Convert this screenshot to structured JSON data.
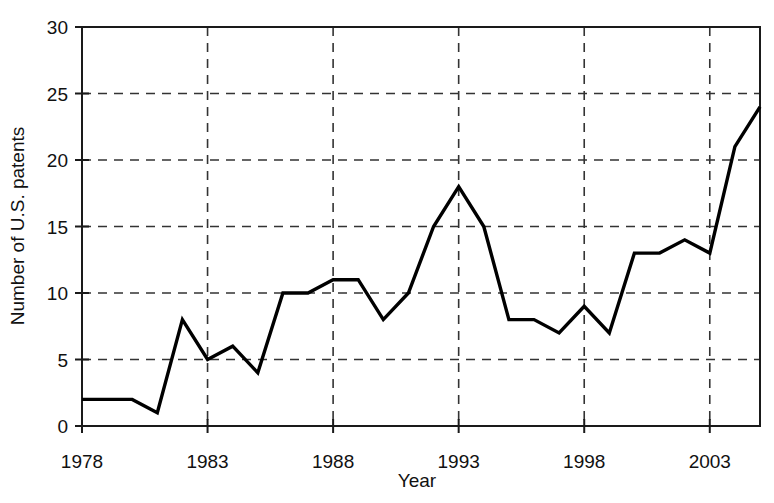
{
  "chart_data": {
    "type": "line",
    "title": "",
    "xlabel": "Year",
    "ylabel": "Number of U.S. patents",
    "xlim": [
      1978,
      2005
    ],
    "ylim": [
      0,
      30
    ],
    "xticks": [
      1978,
      1983,
      1988,
      1993,
      1998,
      2003
    ],
    "xtick_labels": [
      "1978",
      "1983",
      "1988",
      "1993",
      "1998",
      "2003"
    ],
    "yticks": [
      0,
      5,
      10,
      15,
      20,
      25,
      30
    ],
    "ytick_labels": [
      "0",
      "5",
      "10",
      "15",
      "20",
      "25",
      "30"
    ],
    "grid": "dashed gridlines at both x and y ticks",
    "legend": "none",
    "line_color": "#000000",
    "x": [
      1978,
      1979,
      1980,
      1981,
      1982,
      1983,
      1984,
      1985,
      1986,
      1987,
      1988,
      1989,
      1990,
      1991,
      1992,
      1993,
      1994,
      1995,
      1996,
      1997,
      1998,
      1999,
      2000,
      2001,
      2002,
      2003,
      2004,
      2005
    ],
    "values": [
      2,
      2,
      2,
      1,
      8,
      5,
      6,
      4,
      10,
      10,
      11,
      11,
      8,
      10,
      15,
      18,
      15,
      8,
      8,
      7,
      9,
      7,
      13,
      13,
      14,
      13,
      21,
      24
    ],
    "series": [
      {
        "name": "Number of U.S. patents",
        "values": [
          2,
          2,
          2,
          1,
          8,
          5,
          6,
          4,
          10,
          10,
          11,
          11,
          8,
          10,
          15,
          18,
          15,
          8,
          8,
          7,
          9,
          7,
          13,
          13,
          14,
          13,
          21,
          24
        ]
      }
    ]
  },
  "figure": {
    "background_color": "#ffffff",
    "axis_color": "#1a1a1a",
    "grid_color": "#333333"
  }
}
